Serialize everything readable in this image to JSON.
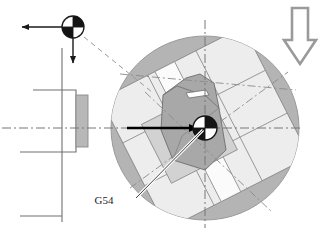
{
  "diagram": {
    "labels": {
      "work_offset": "G54"
    },
    "colors": {
      "table_disc": "#b4b4b4",
      "table_disc_edge": "#9a9a9a",
      "fixture_light": "#ededed",
      "fixture_mid": "#d8d8d8",
      "fixture_dark": "#9e9e9e",
      "machine_block": "#b8b8b8",
      "outline": "#555555",
      "centerline": "#777777",
      "arrow_solid": "#000000",
      "arrow_hollow_stroke": "#9a9a9a",
      "background": "#ffffff"
    },
    "icons": {
      "machine_zero_symbol": "wcs-origin-icon",
      "workpiece_zero_symbol": "wcs-origin-icon",
      "feed_direction": "down-arrow-icon",
      "x_axis_arrow": "left-arrow-icon",
      "z_axis_arrow": "down-arrow-icon",
      "offset_vector_arrow": "right-arrow-icon"
    },
    "elements": {
      "machine_zero_label": "machine-zero-origin-symbol",
      "workpiece_zero_label": "workpiece-zero-origin-symbol",
      "headstock_label": "machine-headstock-outline",
      "rotary_table_label": "rotary-table-disc",
      "fixture_label": "tilted-pallet-fixture",
      "workpiece_label": "workpiece-body",
      "leader_label": "g54-leader-line",
      "dashed_link_label": "origin-to-table-dashed-link"
    },
    "geometry": {
      "table_center": {
        "x": 205,
        "y": 128
      },
      "table_radius_x": 94,
      "table_radius_y": 92,
      "machine_origin": {
        "x": 73,
        "y": 27
      },
      "origin_symbol_radius": 11,
      "center_symbol_radius": 12,
      "fixture_rotation_deg": -27,
      "horizontal_centerline_y": 128,
      "vertical_centerline_x": 205
    }
  }
}
